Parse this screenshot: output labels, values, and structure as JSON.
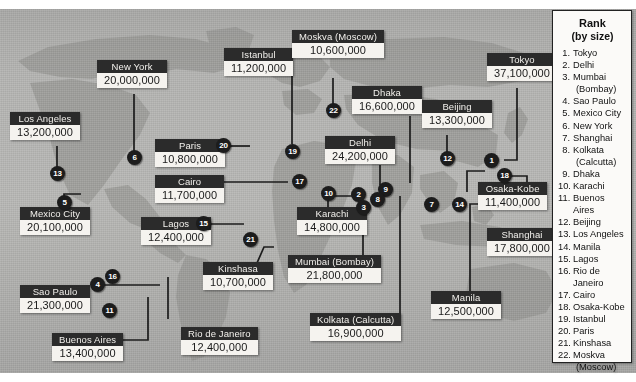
{
  "map": {
    "title": "World's Largest Cities by Population",
    "background_color": "#b0b0ae",
    "label_header_color": "#2b2b2b",
    "label_body_color": "#f5f3ef",
    "marker_color": "#1c1c1c"
  },
  "cities": [
    {
      "id": "los-angeles",
      "name": "Los Angeles",
      "population": "13,200,000",
      "rank": "13"
    },
    {
      "id": "new-york",
      "name": "New York",
      "population": "20,000,000",
      "rank": "6"
    },
    {
      "id": "mexico-city",
      "name": "Mexico City",
      "population": "20,100,000",
      "rank": "5"
    },
    {
      "id": "sao-paulo",
      "name": "Sao Paulo",
      "population": "21,300,000",
      "rank": "4"
    },
    {
      "id": "buenos-aires",
      "name": "Buenos Aires",
      "population": "13,400,000",
      "rank": "11"
    },
    {
      "id": "rio",
      "name": "Rio de Janeiro",
      "population": "12,400,000",
      "rank": "16"
    },
    {
      "id": "lagos",
      "name": "Lagos",
      "population": "12,400,000",
      "rank": "15"
    },
    {
      "id": "kinshasa",
      "name": "Kinshasa",
      "population": "10,700,000",
      "rank": "21"
    },
    {
      "id": "paris",
      "name": "Paris",
      "population": "10,800,000",
      "rank": "20"
    },
    {
      "id": "istanbul",
      "name": "Istanbul",
      "population": "11,200,000",
      "rank": "19"
    },
    {
      "id": "moskva",
      "name": "Moskva (Moscow)",
      "population": "10,600,000",
      "rank": "22"
    },
    {
      "id": "cairo",
      "name": "Cairo",
      "population": "11,700,000",
      "rank": "17"
    },
    {
      "id": "karachi",
      "name": "Karachi",
      "population": "14,800,000",
      "rank": "10"
    },
    {
      "id": "delhi",
      "name": "Delhi",
      "population": "24,200,000",
      "rank": "2"
    },
    {
      "id": "mumbai",
      "name": "Mumbai (Bombay)",
      "population": "21,800,000",
      "rank": "3"
    },
    {
      "id": "dhaka",
      "name": "Dhaka",
      "population": "16,600,000",
      "rank": "9"
    },
    {
      "id": "kolkata",
      "name": "Kolkata (Calcutta)",
      "population": "16,900,000",
      "rank": "8"
    },
    {
      "id": "beijing",
      "name": "Beijing",
      "population": "13,300,000",
      "rank": "12"
    },
    {
      "id": "shanghai",
      "name": "Shanghai",
      "population": "17,800,000",
      "rank": "7"
    },
    {
      "id": "tokyo",
      "name": "Tokyo",
      "population": "37,100,000",
      "rank": "1"
    },
    {
      "id": "osaka-kobe",
      "name": "Osaka-Kobe",
      "population": "11,400,000",
      "rank": "18"
    },
    {
      "id": "manila",
      "name": "Manila",
      "population": "12,500,000",
      "rank": "14"
    }
  ],
  "markers": [
    {
      "label": "13"
    },
    {
      "label": "6"
    },
    {
      "label": "5"
    },
    {
      "label": "4"
    },
    {
      "label": "11"
    },
    {
      "label": "16"
    },
    {
      "label": "15"
    },
    {
      "label": "21"
    },
    {
      "label": "20"
    },
    {
      "label": "19"
    },
    {
      "label": "22"
    },
    {
      "label": "17"
    },
    {
      "label": "10"
    },
    {
      "label": "2"
    },
    {
      "label": "3"
    },
    {
      "label": "9"
    },
    {
      "label": "8"
    },
    {
      "label": "12"
    },
    {
      "label": "7"
    },
    {
      "label": "1"
    },
    {
      "label": "18"
    },
    {
      "label": "14"
    }
  ],
  "rank_panel": {
    "title": "Rank",
    "subtitle": "(by size)",
    "items": [
      {
        "num": "1.",
        "city": "Tokyo",
        "continuation": ""
      },
      {
        "num": "2.",
        "city": "Delhi",
        "continuation": ""
      },
      {
        "num": "3.",
        "city": "Mumbai",
        "continuation": "(Bombay)"
      },
      {
        "num": "4.",
        "city": "Sao Paulo",
        "continuation": ""
      },
      {
        "num": "5.",
        "city": "Mexico City",
        "continuation": ""
      },
      {
        "num": "6.",
        "city": "New York",
        "continuation": ""
      },
      {
        "num": "7.",
        "city": "Shanghai",
        "continuation": ""
      },
      {
        "num": "8.",
        "city": "Kolkata",
        "continuation": "(Calcutta)"
      },
      {
        "num": "9.",
        "city": "Dhaka",
        "continuation": ""
      },
      {
        "num": "10.",
        "city": "Karachi",
        "continuation": ""
      },
      {
        "num": "11.",
        "city": "Buenos Aires",
        "continuation": ""
      },
      {
        "num": "12.",
        "city": "Beijing",
        "continuation": ""
      },
      {
        "num": "13.",
        "city": "Los Angeles",
        "continuation": ""
      },
      {
        "num": "14.",
        "city": "Manila",
        "continuation": ""
      },
      {
        "num": "15.",
        "city": "Lagos",
        "continuation": ""
      },
      {
        "num": "16.",
        "city": "Rio de Janeiro",
        "continuation": ""
      },
      {
        "num": "17.",
        "city": "Cairo",
        "continuation": ""
      },
      {
        "num": "18.",
        "city": "Osaka-Kobe",
        "continuation": ""
      },
      {
        "num": "19.",
        "city": "Istanbul",
        "continuation": ""
      },
      {
        "num": "20.",
        "city": "Paris",
        "continuation": ""
      },
      {
        "num": "21.",
        "city": "Kinshasa",
        "continuation": ""
      },
      {
        "num": "22.",
        "city": "Moskva",
        "continuation": "(Moscow)"
      }
    ]
  }
}
